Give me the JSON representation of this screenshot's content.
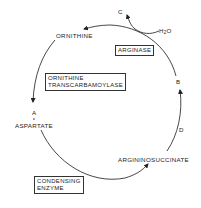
{
  "diagram": {
    "type": "metabolic-cycle",
    "title": "",
    "nodes": {
      "ornithine": "ORNITHINE",
      "aspartate": "ASPARTATE",
      "argininosuccinate": "ARGININOSUCCINATE",
      "a": "A",
      "b": "B",
      "c": "C",
      "d": "D",
      "water": {
        "main": "H",
        "sub": "2",
        "tail": "O"
      }
    },
    "enzymes": {
      "arginase": "ARGINASE",
      "ornithine_transcarbamoylase": {
        "line1": "ORNITHINE",
        "line2": "TRANSCARBAMOYLASE"
      },
      "condensing_enzyme": {
        "line1": "CONDENSING",
        "line2": "ENZYME"
      }
    },
    "flow": [
      "ORNITHINE -> A (via ORNITHINE TRANSCARBAMOYLASE)",
      "A + ASPARTATE -> ARGININOSUCCINATE (via CONDENSING ENZYME)",
      "ARGININOSUCCINATE -> D + B",
      "B + H2O -> C + ORNITHINE (via ARGINASE)"
    ],
    "colors": {
      "line": "#333333",
      "text": "#222222",
      "background": "#ffffff"
    }
  }
}
